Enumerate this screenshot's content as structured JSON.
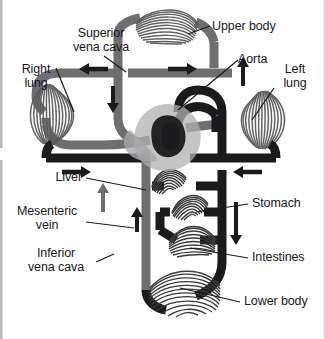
{
  "figure": {
    "background_color": "#ffffff",
    "width": 326,
    "height": 339
  },
  "colors": {
    "deoxygenated_vessel": "#6e6e70",
    "oxygenated_vessel": "#1b1b1d",
    "heart_silhouette": "#b0b0b2",
    "heart_chamber": "#232325",
    "capillary_bed": "#4a4a4c",
    "label_text": "#18181a",
    "leader_line": "#1b1b1d",
    "arrow": "#1b1b1d",
    "edge_artifact": "#b8b8ba"
  },
  "labels": [
    {
      "id": "superior-vena-cava",
      "text": "Superior\nvena cava",
      "align": "center"
    },
    {
      "id": "upper-body",
      "text": "Upper body",
      "align": "left"
    },
    {
      "id": "aorta",
      "text": "Aorta",
      "align": "left"
    },
    {
      "id": "right-lung",
      "text": "Right\nlung",
      "align": "center"
    },
    {
      "id": "left-lung",
      "text": "Left\nlung",
      "align": "center"
    },
    {
      "id": "liver",
      "text": "Liver",
      "align": "right"
    },
    {
      "id": "mesenteric-vein",
      "text": "Mesenteric\nvein",
      "align": "center"
    },
    {
      "id": "inferior-vena-cava",
      "text": "Inferior\nvena cava",
      "align": "center"
    },
    {
      "id": "stomach",
      "text": "Stomach",
      "align": "left"
    },
    {
      "id": "intestines",
      "text": "Intestines",
      "align": "left"
    },
    {
      "id": "lower-body",
      "text": "Lower body",
      "align": "left"
    }
  ],
  "capillary_beds": [
    {
      "id": "upper-body-bed",
      "label": "Upper body"
    },
    {
      "id": "right-lung-bed",
      "label": "Right lung"
    },
    {
      "id": "left-lung-bed",
      "label": "Left lung"
    },
    {
      "id": "liver-bed",
      "label": "Liver"
    },
    {
      "id": "stomach-bed",
      "label": "Stomach"
    },
    {
      "id": "intestines-bed",
      "label": "Intestines"
    },
    {
      "id": "lower-body-bed",
      "label": "Lower body"
    }
  ],
  "flow_arrows": [
    {
      "id": "upper-left-arrow",
      "direction": "left",
      "vessel": "superior vena cava return"
    },
    {
      "id": "upper-right-arrow",
      "direction": "right",
      "vessel": "aortic arch to upper body"
    },
    {
      "id": "svc-descending-arrow",
      "direction": "down",
      "vessel": "superior vena cava"
    },
    {
      "id": "aorta-ascending-arrow",
      "direction": "up",
      "vessel": "aorta"
    },
    {
      "id": "right-lung-out-arrow",
      "direction": "right",
      "vessel": "pulmonary vein right"
    },
    {
      "id": "left-lung-out-arrow",
      "direction": "left",
      "vessel": "pulmonary vein left"
    },
    {
      "id": "hepatic-vein-arrow",
      "direction": "up",
      "vessel": "hepatic vein"
    },
    {
      "id": "mesenteric-vein-arrow",
      "direction": "up",
      "vessel": "mesenteric vein"
    },
    {
      "id": "descending-aorta-arrow",
      "direction": "down",
      "vessel": "descending aorta"
    }
  ]
}
